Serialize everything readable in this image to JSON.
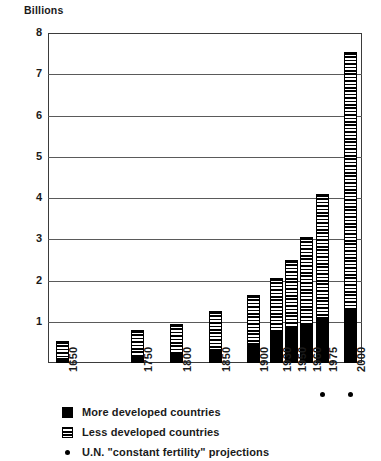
{
  "chart_data": {
    "type": "bar",
    "title": "",
    "subtitle": "",
    "xlabel": "",
    "ylabel": "Billions",
    "ylim": [
      0,
      8
    ],
    "ytick_labels": [
      "1",
      "2",
      "3",
      "4",
      "5",
      "6",
      "7",
      "8"
    ],
    "yticks": [
      1,
      2,
      3,
      4,
      5,
      6,
      7,
      8
    ],
    "grid": true,
    "legend_position": "below-axis",
    "stacked": true,
    "categories": [
      "1650",
      "1750",
      "1800",
      "1850",
      "1900",
      "1930",
      "1950",
      "1960",
      "1975",
      "2000"
    ],
    "series": [
      {
        "name": "More developed countries",
        "values": [
          0.1,
          0.17,
          0.2,
          0.28,
          0.45,
          0.76,
          0.85,
          0.95,
          1.1,
          1.28
        ]
      },
      {
        "name": "Less developed countries",
        "values": [
          0.43,
          0.63,
          0.75,
          0.97,
          1.2,
          1.31,
          1.65,
          2.1,
          3.0,
          6.27
        ]
      }
    ],
    "totals": [
      0.53,
      0.8,
      0.95,
      1.25,
      1.65,
      2.07,
      2.5,
      3.05,
      4.1,
      7.55
    ],
    "projection_categories": [
      "1975",
      "2000"
    ],
    "annotations": [
      "U.N. \"constant fertility\" projections apply to 1975 and 2000 bars"
    ],
    "colors": {
      "more_developed": "#000000",
      "less_developed_hatch": "#000000",
      "background": "#ffffff",
      "grid": "#5a5a5a",
      "frame": "#3b3b3b"
    }
  },
  "axis": {
    "y_title": "Billions"
  },
  "legend": {
    "items": [
      {
        "label": "More developed countries",
        "marker": "solid-square-swatch"
      },
      {
        "label": "Less developed countries",
        "marker": "hatched-square-swatch"
      },
      {
        "label": "U.N. \"constant fertility\" projections",
        "marker": "dot-marker"
      }
    ]
  }
}
